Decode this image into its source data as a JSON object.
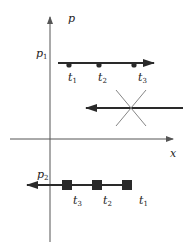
{
  "diagram": {
    "axes": {
      "y_label": "p",
      "x_label": "x"
    },
    "levels": {
      "p1_label": "p",
      "p1_sub": "1",
      "p2_label": "p",
      "p2_sub": "2"
    },
    "top_trajectory": {
      "direction": "right",
      "markers": "circle",
      "times": [
        {
          "label": "t",
          "sub": "1"
        },
        {
          "label": "t",
          "sub": "2"
        },
        {
          "label": "t",
          "sub": "3"
        }
      ]
    },
    "middle_trajectory": {
      "direction": "left",
      "crossed_out": true
    },
    "bottom_trajectory": {
      "direction": "left",
      "markers": "square",
      "times": [
        {
          "label": "t",
          "sub": "3"
        },
        {
          "label": "t",
          "sub": "2"
        },
        {
          "label": "t",
          "sub": "1"
        }
      ]
    },
    "colors": {
      "axis": "#555555",
      "trajectory": "#2a2a2a",
      "cross": "#777777"
    }
  }
}
